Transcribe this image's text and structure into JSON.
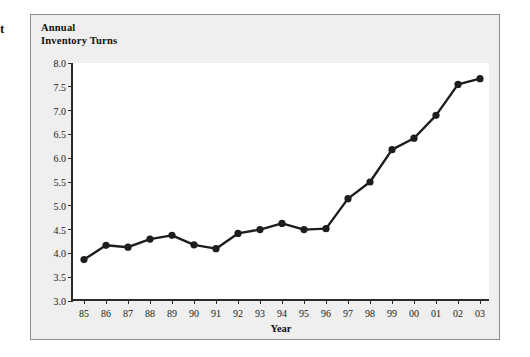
{
  "edge_fragment": "t",
  "caption": {
    "line1": "Annual",
    "line2": "Inventory Turns"
  },
  "chart_data": {
    "type": "line",
    "title": "Annual Inventory Turns",
    "xlabel": "Year",
    "ylabel": "",
    "categories": [
      "85",
      "86",
      "87",
      "88",
      "89",
      "90",
      "91",
      "92",
      "93",
      "94",
      "95",
      "96",
      "97",
      "98",
      "99",
      "00",
      "01",
      "02",
      "03"
    ],
    "values": [
      3.87,
      4.17,
      4.13,
      4.3,
      4.38,
      4.18,
      4.1,
      4.42,
      4.5,
      4.63,
      4.5,
      4.52,
      5.15,
      5.5,
      6.18,
      6.42,
      6.9,
      7.55,
      7.67
    ],
    "series": [
      {
        "name": "Annual Inventory Turns",
        "values": [
          3.87,
          4.17,
          4.13,
          4.3,
          4.38,
          4.18,
          4.1,
          4.42,
          4.5,
          4.63,
          4.5,
          4.52,
          5.15,
          5.5,
          6.18,
          6.42,
          6.9,
          7.55,
          7.67
        ]
      }
    ],
    "ylim": [
      3.0,
      8.0
    ],
    "ytick_step": 0.5,
    "yticks": [
      "8.0",
      "7.5",
      "7.0",
      "6.5",
      "6.0",
      "5.5",
      "5.0",
      "4.5",
      "4.0",
      "3.5",
      "3.0"
    ],
    "grid": false,
    "legend": "none",
    "marker": "filled-circle",
    "line_color": "#1d1d1d",
    "marker_color": "#1d1d1d",
    "plot_background": "#ffffff",
    "panel_background": "#efefef"
  }
}
